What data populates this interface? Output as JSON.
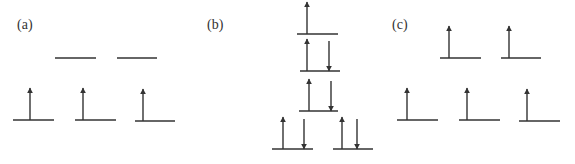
{
  "colors": {
    "ink": "#333333",
    "background": "#ffffff"
  },
  "panels": [
    {
      "id": "a",
      "label": "(a)",
      "label_pos": [
        17,
        29
      ],
      "levels": [
        {
          "x1": 55,
          "x2": 96,
          "y": 58,
          "spins": []
        },
        {
          "x1": 117,
          "x2": 157,
          "y": 58,
          "spins": []
        },
        {
          "x1": 13,
          "x2": 54,
          "y": 120,
          "spins": [
            {
              "dir": "up",
              "x": 30
            }
          ]
        },
        {
          "x1": 75,
          "x2": 116,
          "y": 120,
          "spins": [
            {
              "dir": "up",
              "x": 83
            }
          ]
        },
        {
          "x1": 135,
          "x2": 175,
          "y": 121,
          "spins": [
            {
              "dir": "up",
              "x": 143
            }
          ]
        }
      ]
    },
    {
      "id": "b",
      "label": "(b)",
      "label_pos": [
        207,
        29
      ],
      "levels": [
        {
          "x1": 297,
          "x2": 338,
          "y": 34,
          "spins": [
            {
              "dir": "up",
              "x": 307
            }
          ]
        },
        {
          "x1": 300,
          "x2": 340,
          "y": 71,
          "spins": [
            {
              "dir": "up",
              "x": 307
            },
            {
              "dir": "down",
              "x": 329
            }
          ]
        },
        {
          "x1": 299,
          "x2": 338,
          "y": 111,
          "spins": [
            {
              "dir": "up",
              "x": 309
            },
            {
              "dir": "down",
              "x": 331
            }
          ]
        },
        {
          "x1": 272,
          "x2": 313,
          "y": 149,
          "spins": [
            {
              "dir": "up",
              "x": 283
            },
            {
              "dir": "down",
              "x": 304
            }
          ]
        },
        {
          "x1": 333,
          "x2": 373,
          "y": 149,
          "spins": [
            {
              "dir": "up",
              "x": 342
            },
            {
              "dir": "down",
              "x": 357
            }
          ]
        }
      ]
    },
    {
      "id": "c",
      "label": "(c)",
      "label_pos": [
        392,
        29
      ],
      "levels": [
        {
          "x1": 440,
          "x2": 481,
          "y": 58,
          "spins": [
            {
              "dir": "up",
              "x": 449
            }
          ]
        },
        {
          "x1": 501,
          "x2": 541,
          "y": 58,
          "spins": [
            {
              "dir": "up",
              "x": 509
            }
          ]
        },
        {
          "x1": 397,
          "x2": 438,
          "y": 120,
          "spins": [
            {
              "dir": "up",
              "x": 407
            }
          ]
        },
        {
          "x1": 459,
          "x2": 500,
          "y": 120,
          "spins": [
            {
              "dir": "up",
              "x": 467
            }
          ]
        },
        {
          "x1": 519,
          "x2": 560,
          "y": 121,
          "spins": [
            {
              "dir": "up",
              "x": 527
            }
          ]
        }
      ]
    }
  ],
  "spin_arrow_length": 32
}
